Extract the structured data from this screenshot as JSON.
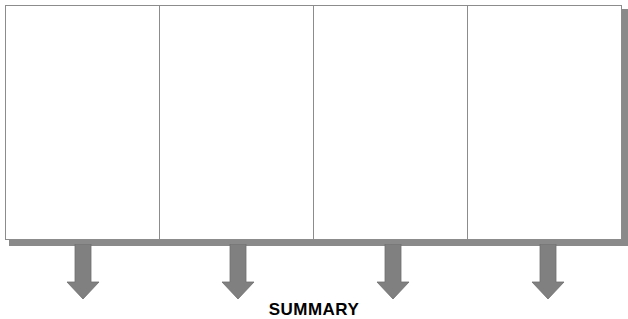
{
  "diagram": {
    "columns": [
      {
        "label": ""
      },
      {
        "label": ""
      },
      {
        "label": ""
      },
      {
        "label": ""
      }
    ],
    "arrows": [
      {
        "direction": "down",
        "center_x": 83
      },
      {
        "direction": "down",
        "center_x": 238
      },
      {
        "direction": "down",
        "center_x": 393
      },
      {
        "direction": "down",
        "center_x": 548
      }
    ],
    "summary_label": "SUMMARY",
    "colors": {
      "border": "#8c8c8c",
      "shadow": "#8a8a8a",
      "arrow": "#808080"
    }
  }
}
